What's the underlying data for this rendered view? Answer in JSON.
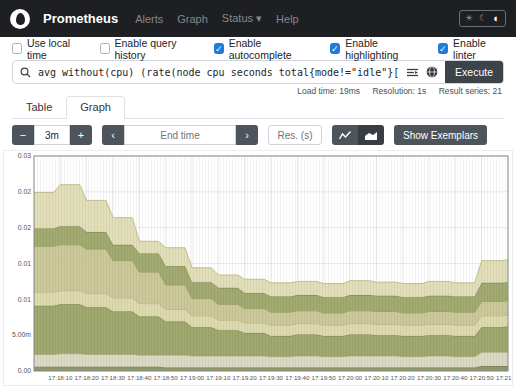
{
  "navbar": {
    "brand": "Prometheus",
    "items": [
      {
        "label": "Alerts",
        "has_caret": false
      },
      {
        "label": "Graph",
        "has_caret": false
      },
      {
        "label": "Status",
        "has_caret": true
      },
      {
        "label": "Help",
        "has_caret": false
      }
    ],
    "theme_icons": [
      {
        "name": "sun-icon",
        "active": false
      },
      {
        "name": "moon-icon",
        "active": false
      },
      {
        "name": "circle-half-icon",
        "active": true
      }
    ]
  },
  "options": {
    "accent": "#2178dd",
    "checkboxes": [
      {
        "label": "Use local time",
        "checked": false
      },
      {
        "label": "Enable query history",
        "checked": false
      },
      {
        "label": "Enable autocomplete",
        "checked": true
      },
      {
        "label": "Enable highlighting",
        "checked": true
      },
      {
        "label": "Enable linter",
        "checked": true
      }
    ]
  },
  "query": {
    "expression": "avg without(cpu) (rate(node_cpu_seconds_total{mode!=\"idle\"}[1m]))",
    "execute_label": "Execute"
  },
  "stats": {
    "load_time": "Load time: 19ms",
    "resolution": "Resolution: 1s",
    "result_series": "Result series: 21"
  },
  "tabs": [
    {
      "label": "Table",
      "active": false
    },
    {
      "label": "Graph",
      "active": true
    }
  ],
  "graph_controls": {
    "zoom_out": "−",
    "range_value": "3m",
    "zoom_in": "+",
    "prev": "‹",
    "end_time_placeholder": "End time",
    "next": "›",
    "res_placeholder": "Res. (s)",
    "show_exemplars": "Show Exemplars"
  },
  "chart_data": {
    "type": "area",
    "stacked": true,
    "grid": true,
    "ylim": [
      0,
      0.03
    ],
    "y_ticks": [
      {
        "label": "0.03",
        "value": 0.03
      },
      {
        "label": "0.02",
        "value": 0.025
      },
      {
        "label": "0.02",
        "value": 0.02
      },
      {
        "label": "0.01",
        "value": 0.015
      },
      {
        "label": "0.01",
        "value": 0.01
      },
      {
        "label": "5.00m",
        "value": 0.005
      },
      {
        "label": "0.00",
        "value": 0
      }
    ],
    "x_labels": [
      "17:18:10",
      "17:18:20",
      "17:18:30",
      "17:18:40",
      "17:18:50",
      "17:19:00",
      "17:19:10",
      "17:19:20",
      "17:19:30",
      "17:19:40",
      "17:19:50",
      "17:20:00",
      "17:20:10",
      "17:20:20",
      "17:20:30",
      "17:20:40",
      "17:20:50",
      "17:21:00"
    ],
    "series": [
      {
        "name": "band-1",
        "color": "#87905f",
        "stroke": "#6a7544",
        "values": [
          0.0006,
          0.0006,
          0.0006,
          0.0006,
          0.0006,
          0.0005,
          0.0005,
          0.0005,
          0.0005,
          0.0005,
          0.0005,
          0.0005,
          0.0005,
          0.0005,
          0.0005,
          0.0005,
          0.0005,
          0.0007,
          0.0007
        ]
      },
      {
        "name": "band-2",
        "color": "#d7d7bf",
        "stroke": "#b8b896",
        "values": [
          0.0017,
          0.0018,
          0.0017,
          0.0017,
          0.0016,
          0.0017,
          0.0016,
          0.0016,
          0.0016,
          0.0015,
          0.0016,
          0.0015,
          0.0016,
          0.0016,
          0.0015,
          0.0016,
          0.0015,
          0.0019,
          0.0019
        ]
      },
      {
        "name": "band-3",
        "color": "#98a164",
        "stroke": "#727d3e",
        "values": [
          0.0068,
          0.0069,
          0.0066,
          0.006,
          0.0054,
          0.0047,
          0.004,
          0.0036,
          0.0032,
          0.0029,
          0.003,
          0.0029,
          0.003,
          0.0029,
          0.0029,
          0.0029,
          0.0029,
          0.0035,
          0.0036
        ]
      },
      {
        "name": "band-4",
        "color": "#dad7a9",
        "stroke": "#b6b27c",
        "values": [
          0.0019,
          0.0019,
          0.0019,
          0.0019,
          0.0018,
          0.0017,
          0.0016,
          0.0014,
          0.0014,
          0.0015,
          0.0015,
          0.0015,
          0.0015,
          0.0015,
          0.0015,
          0.0015,
          0.0015,
          0.0016,
          0.0016
        ]
      },
      {
        "name": "band-5",
        "color": "#c7c591",
        "stroke": "#9e9b61",
        "values": [
          0.0064,
          0.0064,
          0.0062,
          0.0052,
          0.0044,
          0.0034,
          0.0024,
          0.0022,
          0.002,
          0.0018,
          0.0018,
          0.0017,
          0.0018,
          0.0018,
          0.0017,
          0.0018,
          0.0018,
          0.002,
          0.002
        ]
      },
      {
        "name": "band-6",
        "color": "#9ba467",
        "stroke": "#757f41",
        "values": [
          0.0025,
          0.0026,
          0.0024,
          0.0022,
          0.0026,
          0.0026,
          0.0023,
          0.0023,
          0.0022,
          0.0022,
          0.0022,
          0.0022,
          0.0022,
          0.0022,
          0.0022,
          0.0022,
          0.0022,
          0.0026,
          0.0026
        ]
      },
      {
        "name": "band-7",
        "color": "#dfdcb4",
        "stroke": "#bfbb86",
        "values": [
          0.005,
          0.0058,
          0.0044,
          0.0038,
          0.0017,
          0.0026,
          0.002,
          0.0018,
          0.0019,
          0.0019,
          0.0019,
          0.0019,
          0.002,
          0.0019,
          0.0019,
          0.002,
          0.0019,
          0.0031,
          0.0031
        ]
      }
    ]
  }
}
